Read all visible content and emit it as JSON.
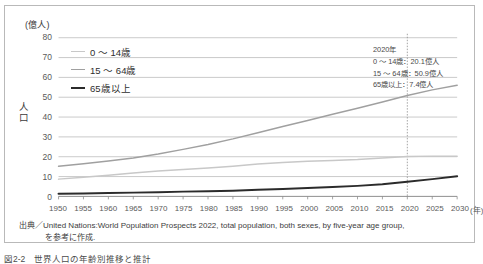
{
  "unit_label": "(億人)",
  "yaxis_title": "人口",
  "xaxis_unit": "(年)",
  "legend": [
    {
      "label": "0 〜 14歳",
      "color": "#c8c8c8",
      "width": 1.6
    },
    {
      "label": "15 〜 64歳",
      "color": "#a0a0a0",
      "width": 1.6
    },
    {
      "label": "65歳以上",
      "color": "#2b2b2b",
      "width": 2.2
    }
  ],
  "annotation": {
    "year": "2020年",
    "lines": [
      "0 〜 14歳：20.1億人",
      "15 〜 64歳：50.9億人",
      "65歳以上：7.4億人"
    ]
  },
  "source": {
    "line1": "出典／United Nations:World Population Prospects 2022, total population, both sexes, by five-year age group,",
    "line2": "を参考に作成."
  },
  "caption": "図2-2　世界人口の年齢別推移と推計",
  "colors": {
    "grid": "#bcbcbc",
    "axis": "#8d8d8d",
    "marker_line": "#9a9a9a",
    "frame": "#b9b9b9",
    "text": "#3b3b3b"
  },
  "chart_data": {
    "type": "line",
    "title": "図2-2　世界人口の年齢別推移と推計",
    "xlabel": "(年)",
    "ylabel": "人口",
    "unit": "億人",
    "xlim": [
      1950,
      2030
    ],
    "ylim": [
      0,
      80
    ],
    "yticks": [
      0,
      10,
      20,
      30,
      40,
      50,
      60,
      70,
      80
    ],
    "grid": true,
    "legend_position": "upper-left-inside",
    "x": [
      1950,
      1955,
      1960,
      1965,
      1970,
      1975,
      1980,
      1985,
      1990,
      1995,
      2000,
      2005,
      2010,
      2015,
      2020,
      2025,
      2030
    ],
    "series": [
      {
        "name": "0 〜 14歳",
        "color": "#c8c8c8",
        "values": [
          8.7,
          9.6,
          10.6,
          11.8,
          12.8,
          13.6,
          14.3,
          15.2,
          16.3,
          17.1,
          17.7,
          18.1,
          18.6,
          19.4,
          20.1,
          20.3,
          20.2
        ]
      },
      {
        "name": "15 〜 64歳",
        "color": "#a0a0a0",
        "values": [
          15.2,
          16.4,
          17.8,
          19.4,
          21.4,
          23.7,
          26.2,
          29.0,
          32.1,
          35.2,
          38.3,
          41.4,
          44.4,
          47.6,
          50.9,
          53.7,
          56.0
        ]
      },
      {
        "name": "65歳以上",
        "color": "#2b2b2b",
        "values": [
          1.3,
          1.5,
          1.7,
          1.9,
          2.1,
          2.4,
          2.6,
          2.9,
          3.3,
          3.7,
          4.2,
          4.7,
          5.3,
          6.1,
          7.4,
          8.7,
          10.1
        ]
      }
    ],
    "markers": [
      {
        "type": "vertical-dotted-line",
        "x": 2020,
        "label": "2020年",
        "values": {
          "0 〜 14歳": 20.1,
          "15 〜 64歳": 50.9,
          "65歳以上": 7.4
        }
      }
    ],
    "xtick_labels": [
      "1950",
      "1955",
      "1960",
      "1965",
      "1970",
      "1975",
      "1980",
      "1985",
      "1990",
      "1995",
      "2000",
      "2005",
      "2010",
      "2015",
      "2020",
      "2025",
      "2030"
    ]
  }
}
